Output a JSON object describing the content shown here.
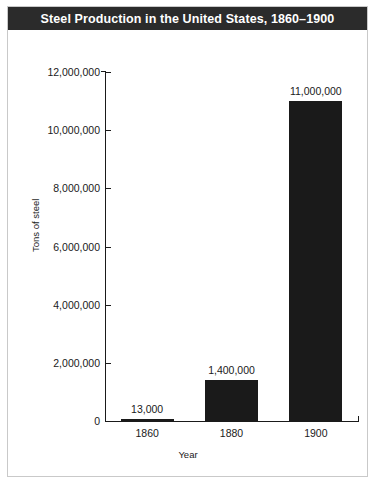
{
  "chart_data": {
    "type": "bar",
    "title": "Steel Production in the United States, 1860–1900",
    "xlabel": "Year",
    "ylabel": "Tons of steel",
    "categories": [
      "1860",
      "1880",
      "1900"
    ],
    "values": [
      13000,
      1400000,
      11000000
    ],
    "value_labels": [
      "13,000",
      "1,400,000",
      "11,000,000"
    ],
    "ylim": [
      0,
      12000000
    ],
    "ytick_values": [
      0,
      2000000,
      4000000,
      6000000,
      8000000,
      10000000,
      12000000
    ],
    "ytick_labels": [
      "0",
      "2,000,000",
      "4,000,000",
      "6,000,000",
      "8,000,000",
      "10,000,000",
      "12,000,000"
    ],
    "grid": false,
    "legend": "none",
    "bar_color": "#1a1a1a",
    "title_background": "#2b2b2b",
    "title_color": "#ffffff",
    "frame_color": "#c9c9c9",
    "background": "#ffffff"
  }
}
